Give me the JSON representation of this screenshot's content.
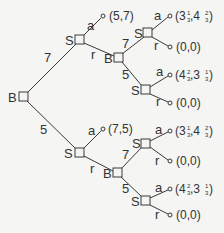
{
  "tree": {
    "nodes": [
      {
        "id": "root",
        "player": "B",
        "x": 19,
        "y": 92
      },
      {
        "id": "s_upper",
        "player": "S",
        "x": 75,
        "y": 35
      },
      {
        "id": "b_upper",
        "player": "B",
        "x": 114,
        "y": 53
      },
      {
        "id": "s_uu",
        "player": "S",
        "x": 143,
        "y": 28
      },
      {
        "id": "s_ul",
        "player": "S",
        "x": 141,
        "y": 85
      },
      {
        "id": "s_lower",
        "player": "S",
        "x": 75,
        "y": 148
      },
      {
        "id": "b_lower",
        "player": "B",
        "x": 113,
        "y": 168
      },
      {
        "id": "s_lu",
        "player": "S",
        "x": 141,
        "y": 139
      },
      {
        "id": "s_ll",
        "player": "S",
        "x": 141,
        "y": 196
      }
    ],
    "edges": {
      "root_to_s_upper": "7",
      "root_to_s_lower": "5",
      "s_upper_accept": "a",
      "s_upper_reject": "r",
      "b_upper_high": "7",
      "b_upper_low": "5",
      "s_uu_accept": "a",
      "s_uu_reject": "r",
      "s_ul_accept": "a",
      "s_ul_reject": "r",
      "s_lower_accept": "a",
      "s_lower_reject": "r",
      "b_lower_high": "7",
      "b_lower_low": "5",
      "s_lu_accept": "a",
      "s_lu_reject": "r",
      "s_ll_accept": "a",
      "s_ll_reject": "r"
    },
    "payoffs": {
      "p1": "(5,7)",
      "p2_a": "(3",
      "p2_a_num": "1",
      "p2_a_den": "3",
      "p2_b": ",4",
      "p2_b_num": "2",
      "p2_b_den": "3",
      "p2_c": ")",
      "p3": "(0,0)",
      "p4_a": "(4",
      "p4_a_num": "2",
      "p4_a_den": "3",
      "p4_b": ",3",
      "p4_b_num": "1",
      "p4_b_den": "3",
      "p4_c": ")",
      "p5": "(0,0)",
      "p6": "(7,5)",
      "p7_a": "(3",
      "p7_a_num": "1",
      "p7_a_den": "3",
      "p7_b": ",4",
      "p7_b_num": "2",
      "p7_b_den": "3",
      "p7_c": ")",
      "p8": "(0,0)",
      "p9_a": "(4",
      "p9_a_num": "2",
      "p9_a_den": "3",
      "p9_b": ",3",
      "p9_b_num": "1",
      "p9_b_den": "3",
      "p9_c": ")",
      "p10": "(0,0)"
    },
    "players": {
      "B": "B",
      "S": "S"
    }
  }
}
